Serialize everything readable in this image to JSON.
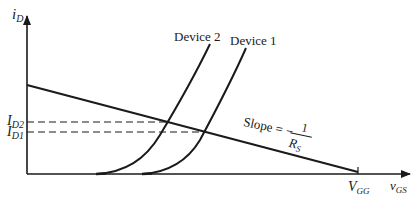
{
  "diagram": {
    "type": "transfer-characteristic-with-load-line",
    "axes": {
      "y_label_main": "i",
      "y_label_sub": "D",
      "x_label_main": "v",
      "x_label_sub": "GS"
    },
    "curves": [
      {
        "name": "Device 2",
        "label": "Device 2"
      },
      {
        "name": "Device 1",
        "label": "Device 1"
      }
    ],
    "levels": [
      {
        "main": "I",
        "sub": "D2"
      },
      {
        "main": "I",
        "sub": "D1"
      }
    ],
    "load_line": {
      "slope_text": "Slope = −",
      "numerator": "1",
      "denominator_main": "R",
      "denominator_sub": "S"
    },
    "x_intercept": {
      "main": "V",
      "sub": "GG"
    },
    "colors": {
      "ink": "#1a1a1a",
      "background": "#ffffff"
    }
  }
}
